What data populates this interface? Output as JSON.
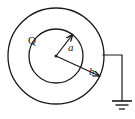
{
  "figure": {
    "type": "physics-diagram",
    "canvas": {
      "width": 135,
      "height": 119,
      "background": "#ffffff"
    },
    "stroke_color": "#1a1a1a"
  },
  "geometry": {
    "center": {
      "x": 56,
      "y": 56
    },
    "outer_circle": {
      "cx": 56,
      "cy": 56,
      "r": 48,
      "stroke_width": 1.3
    },
    "inner_circle": {
      "cx": 56,
      "cy": 56,
      "r": 27,
      "stroke_width": 1.3
    },
    "radius_a": {
      "from": {
        "x": 56,
        "y": 56
      },
      "to": {
        "x": 72.5,
        "y": 34.6
      },
      "stroke_width": 1.2
    },
    "radius_b": {
      "from": {
        "x": 56,
        "y": 56
      },
      "to": {
        "x": 99.5,
        "y": 76.0
      },
      "stroke_width": 1.2
    },
    "ground_wire": {
      "start": {
        "x": 103,
        "y": 55
      },
      "corner": {
        "x": 122,
        "y": 55
      },
      "end": {
        "x": 122,
        "y": 101
      },
      "stroke_width": 1.2
    },
    "ground_symbol": {
      "cx": 122,
      "bars": [
        {
          "y": 101,
          "half_width": 10.0,
          "stroke_width": 1.6
        },
        {
          "y": 105,
          "half_width": 6.5,
          "stroke_width": 1.4
        },
        {
          "y": 109,
          "half_width": 3.0,
          "stroke_width": 1.3
        }
      ]
    }
  },
  "labels": {
    "charge": {
      "text": "Q",
      "x": 28,
      "y": 44,
      "font_size": 11
    },
    "inner_radius": {
      "text": "a",
      "x": 68,
      "y": 51,
      "font_size": 11
    },
    "outer_radius": {
      "text": "b",
      "x": 89,
      "y": 75,
      "font_size": 11
    }
  },
  "chart_data": {
    "type": "diagram",
    "elements": [
      {
        "name": "outer-shell-boundary",
        "shape": "circle",
        "radius_label": "b",
        "radius_px": 48
      },
      {
        "name": "inner-cavity-boundary",
        "shape": "circle",
        "radius_label": "a",
        "radius_px": 27
      },
      {
        "name": "charge-label",
        "shape": "text",
        "value": "Q"
      },
      {
        "name": "inner-radius-arrow",
        "shape": "line",
        "value": "a"
      },
      {
        "name": "outer-radius-arrow",
        "shape": "line",
        "value": "b"
      },
      {
        "name": "ground-connection",
        "shape": "wire+ground-symbol",
        "value": "earth ground"
      }
    ]
  }
}
